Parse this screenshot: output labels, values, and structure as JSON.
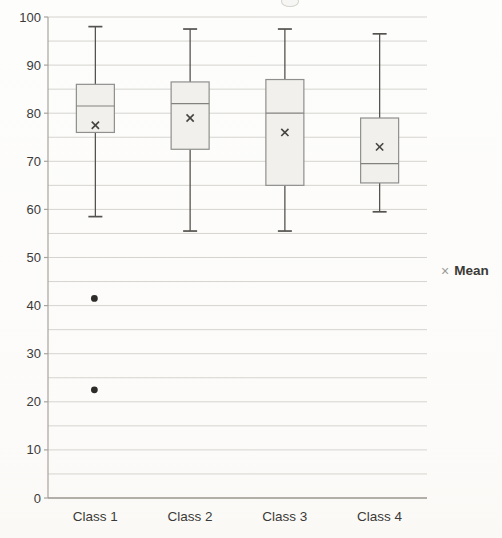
{
  "chart_data": {
    "type": "boxplot",
    "title": "",
    "categories": [
      "Class 1",
      "Class 2",
      "Class 3",
      "Class 4"
    ],
    "series": [
      {
        "name": "Class 1",
        "min": 58.5,
        "q1": 76,
        "median": 81.5,
        "q3": 86,
        "max": 98,
        "mean": 77.5,
        "outliers": [
          41.5,
          22.5
        ]
      },
      {
        "name": "Class 2",
        "min": 55.5,
        "q1": 72.5,
        "median": 82,
        "q3": 86.5,
        "max": 97.5,
        "mean": 79,
        "outliers": []
      },
      {
        "name": "Class 3",
        "min": 55.5,
        "q1": 65,
        "median": 80,
        "q3": 87,
        "max": 97.5,
        "mean": 76,
        "outliers": []
      },
      {
        "name": "Class 4",
        "min": 59.5,
        "q1": 65.5,
        "median": 69.5,
        "q3": 79,
        "max": 96.5,
        "mean": 73,
        "outliers": []
      }
    ],
    "ylim": [
      0,
      100
    ],
    "y_tick_labels": [
      "0",
      "10",
      "20",
      "30",
      "40",
      "50",
      "60",
      "70",
      "80",
      "90",
      "100"
    ],
    "y_major_step": 10,
    "y_minor_gridline_step": 5,
    "grid": true,
    "legend": {
      "marker": "×",
      "label": "Mean",
      "position": "middle-right"
    }
  },
  "colors": {
    "gridline": "#d6d4d0",
    "axis_line": "#a8a49e",
    "x_axis_line": "#9a968f",
    "box_fill": "#f1f0ed",
    "box_border": "#8f8f8d",
    "median_line": "#83827f",
    "whisker": "#55534f",
    "mean_marker": "#45443f",
    "outlier": "#2e2c29",
    "text": "#3b3a38",
    "legend_marker": "#9b9995"
  }
}
